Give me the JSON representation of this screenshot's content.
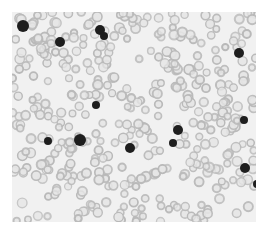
{
  "image": {
    "subject": "blood smear micrograph",
    "background_color": "#ffffff",
    "field_color": "#f1f1f1",
    "rbc_color": "#b9b9b9",
    "rbc_center_color": "#e6e6e6",
    "wbc_color": "#1e1e1e"
  },
  "dark_cells": [
    {
      "x": 11,
      "y": 14,
      "r": 6
    },
    {
      "x": 48,
      "y": 30,
      "r": 5
    },
    {
      "x": 88,
      "y": 18,
      "r": 5
    },
    {
      "x": 92,
      "y": 24,
      "r": 4
    },
    {
      "x": 84,
      "y": 93,
      "r": 4
    },
    {
      "x": 227,
      "y": 41,
      "r": 5
    },
    {
      "x": 36,
      "y": 129,
      "r": 4
    },
    {
      "x": 68,
      "y": 128,
      "r": 6
    },
    {
      "x": 118,
      "y": 136,
      "r": 5
    },
    {
      "x": 166,
      "y": 118,
      "r": 5
    },
    {
      "x": 161,
      "y": 131,
      "r": 4
    },
    {
      "x": 232,
      "y": 108,
      "r": 4
    },
    {
      "x": 233,
      "y": 156,
      "r": 5
    },
    {
      "x": 245,
      "y": 172,
      "r": 4
    }
  ]
}
